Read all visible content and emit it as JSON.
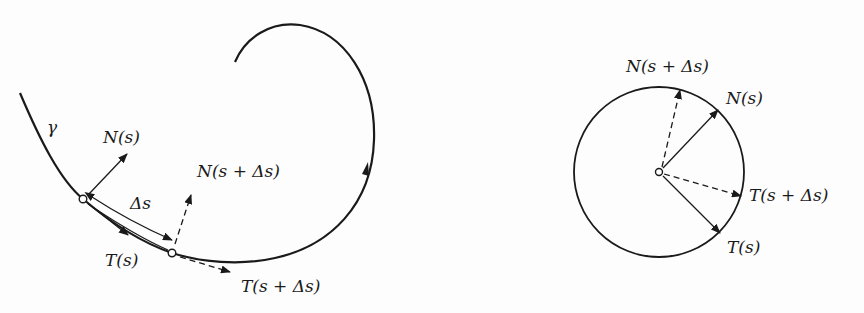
{
  "left_figure": {
    "curve_label": "γ",
    "labels": {
      "normal_s": "N(s)",
      "normal_s_ds": "N(s + Δs)",
      "delta_s": "Δs",
      "tangent_s": "T(s)",
      "tangent_s_ds": "T(s + Δs)"
    }
  },
  "right_figure": {
    "labels": {
      "normal_s_ds": "N(s + Δs)",
      "normal_s": "N(s)",
      "tangent_s_ds": "T(s + Δs)",
      "tangent_s": "T(s)"
    }
  },
  "colors": {
    "stroke": "#1a1a1a",
    "background": "#fdfdfd"
  }
}
